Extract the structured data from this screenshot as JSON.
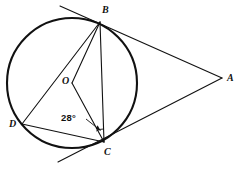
{
  "figure": {
    "background_color": "#ffffff",
    "stroke_color": "#111111",
    "width": 237,
    "height": 169
  },
  "circle": {
    "name": "circle-O",
    "center": {
      "x": 72,
      "y": 83
    },
    "radius": 65,
    "stroke_width": 2.1
  },
  "points": [
    {
      "id": "B",
      "label": "B",
      "x": 100,
      "y": 22,
      "label_x": 102,
      "label_y": 5,
      "on_circle": true
    },
    {
      "id": "A",
      "label": "A",
      "x": 222,
      "y": 78,
      "label_x": 227,
      "label_y": 73,
      "on_circle": false
    },
    {
      "id": "C",
      "label": "C",
      "x": 104,
      "y": 142,
      "label_x": 104,
      "label_y": 147,
      "on_circle": true
    },
    {
      "id": "D",
      "label": "D",
      "x": 22,
      "y": 124,
      "label_x": 9,
      "label_y": 119,
      "on_circle": true
    },
    {
      "id": "O",
      "label": "O",
      "x": 72,
      "y": 83,
      "label_x": 62,
      "label_y": 76,
      "on_circle": false
    }
  ],
  "segments": [
    {
      "name": "tangent-line-through-B",
      "from": {
        "x": 60,
        "y": 6
      },
      "to": {
        "x": 222,
        "y": 78
      },
      "stroke_width": 1.1
    },
    {
      "name": "tangent-line-through-C",
      "from": {
        "x": 58,
        "y": 162
      },
      "to": {
        "x": 222,
        "y": 78
      },
      "stroke_width": 1.1
    },
    {
      "name": "chord-BC",
      "from": {
        "x": 100,
        "y": 22
      },
      "to": {
        "x": 104,
        "y": 142
      },
      "stroke_width": 1.1
    },
    {
      "name": "chord-BD",
      "from": {
        "x": 100,
        "y": 22
      },
      "to": {
        "x": 22,
        "y": 124
      },
      "stroke_width": 1.1
    },
    {
      "name": "chord-DC",
      "from": {
        "x": 22,
        "y": 124
      },
      "to": {
        "x": 104,
        "y": 142
      },
      "stroke_width": 1.1
    },
    {
      "name": "radius-OB",
      "from": {
        "x": 72,
        "y": 83
      },
      "to": {
        "x": 100,
        "y": 22
      },
      "stroke_width": 1.1
    },
    {
      "name": "radius-OC",
      "from": {
        "x": 72,
        "y": 83
      },
      "to": {
        "x": 104,
        "y": 142
      },
      "stroke_width": 1.1
    }
  ],
  "angle_marks": [
    {
      "name": "angle-OCB",
      "label": "28°",
      "vertex": "C",
      "label_x": 61,
      "label_y": 113,
      "arc_path": "M 96.2 131.0 A 13 13 0 0 1 103.6 129.0",
      "leader_from": {
        "x": 86,
        "y": 119
      },
      "leader_to": {
        "x": 100.5,
        "y": 130.5
      }
    }
  ],
  "labels": {
    "point_b": "B",
    "point_a": "A",
    "point_c": "C",
    "point_d": "D",
    "center_o": "O",
    "angle_value": "28°"
  }
}
